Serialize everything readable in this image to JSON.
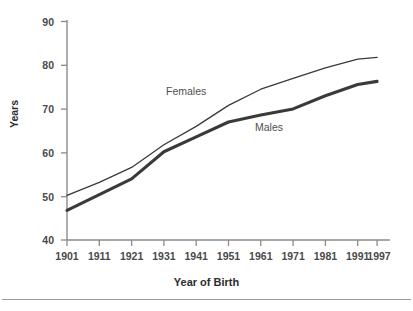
{
  "chart_data": {
    "type": "line",
    "title": "",
    "xlabel": "Year of Birth",
    "ylabel": "Years",
    "categories": [
      "1901",
      "1911",
      "1921",
      "1931",
      "1941",
      "1951",
      "1961",
      "1971",
      "1981",
      "1991",
      "1997"
    ],
    "x": [
      1901,
      1911,
      1921,
      1931,
      1941,
      1951,
      1961,
      1971,
      1981,
      1991,
      1997
    ],
    "series": [
      {
        "name": "Females",
        "color": "#3a3a3a",
        "line_weight": "thin",
        "values": [
          50.2,
          53.2,
          56.6,
          61.8,
          66.0,
          70.8,
          74.5,
          77.0,
          79.4,
          81.4,
          81.8
        ]
      },
      {
        "name": "Males",
        "color": "#3a3a3a",
        "line_weight": "thick",
        "values": [
          46.8,
          50.4,
          54.0,
          60.2,
          63.6,
          67.0,
          68.6,
          70.0,
          73.0,
          75.6,
          76.3
        ]
      }
    ],
    "ylim": [
      40,
      90
    ],
    "yticks": [
      40,
      50,
      60,
      70,
      80,
      90
    ],
    "ytick_labels": [
      "40",
      "50",
      "60",
      "70",
      "80",
      "90"
    ],
    "xtick_labels": [
      "1901",
      "1911",
      "1921",
      "1931",
      "1941",
      "1951",
      "1961",
      "1971",
      "1981",
      "1991",
      "1997"
    ],
    "grid": false,
    "legend_position": "inline-annotations",
    "annotations": [
      {
        "text": "Females",
        "series": "Females"
      },
      {
        "text": "Males",
        "series": "Males"
      }
    ]
  },
  "axes": {
    "y_title": "Years",
    "x_title": "Year of Birth"
  }
}
